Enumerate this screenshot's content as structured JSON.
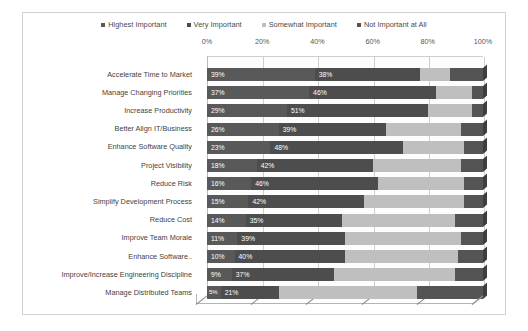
{
  "title": "",
  "legend": {
    "position": "top",
    "items": [
      {
        "label": "Highest Important",
        "color": "#595959"
      },
      {
        "label": "Very Important",
        "color": "#4d4d4d"
      },
      {
        "label": "Somewhat Important",
        "color": "#bfbfbf"
      },
      {
        "label": "Not Important at All",
        "color": "#545454"
      }
    ]
  },
  "axis": {
    "ticks": [
      "0%",
      "20%",
      "40%",
      "60%",
      "80%",
      "100%"
    ],
    "min": 0,
    "max": 100
  },
  "chart_data": {
    "type": "bar",
    "orientation": "horizontal",
    "stacked": true,
    "three_d": true,
    "title": "",
    "xlabel": "",
    "ylabel": "",
    "xlim": [
      0,
      100
    ],
    "grid": true,
    "legend_position": "top",
    "tick_labels": [
      "0%",
      "20%",
      "40%",
      "60%",
      "80%",
      "100%"
    ],
    "categories": [
      "Accelerate Time to Market",
      "Manage Changing Priorities",
      "Increase Productivity",
      "Better Align IT/Business",
      "Enhance Software Quality",
      "Project Visibility",
      "Reduce Risk",
      "Simplify Development Process",
      "Reduce Cost",
      "Improve Team Morale",
      "Enhance Software..",
      "Improve/Increase Engineering Discipline",
      "Manage Distributed Teams"
    ],
    "series": [
      {
        "name": "Highest Important",
        "color": "#595959",
        "values": [
          39,
          37,
          29,
          26,
          23,
          18,
          16,
          15,
          14,
          11,
          10,
          9,
          5
        ],
        "labels": [
          "39%",
          "37%",
          "29%",
          "26%",
          "23%",
          "18%",
          "16%",
          "15%",
          "14%",
          "11%",
          "10%",
          "9%",
          "5%"
        ]
      },
      {
        "name": "Very Important",
        "color": "#4d4d4d",
        "values": [
          38,
          46,
          51,
          39,
          48,
          42,
          46,
          42,
          35,
          39,
          40,
          37,
          21
        ],
        "labels": [
          "38%",
          "46%",
          "51%",
          "39%",
          "48%",
          "42%",
          "46%",
          "42%",
          "35%",
          "39%",
          "40%",
          "37%",
          "21%"
        ]
      },
      {
        "name": "Somewhat Important",
        "color": "#bfbfbf",
        "values": [
          11,
          13,
          16,
          27,
          22,
          32,
          31,
          36,
          41,
          42,
          41,
          44,
          50
        ],
        "labels": [
          "",
          "",
          "",
          "",
          "",
          "",
          "",
          "",
          "",
          "",
          "",
          "",
          ""
        ]
      },
      {
        "name": "Not Important at All",
        "color": "#545454",
        "values": [
          12,
          4,
          4,
          8,
          7,
          8,
          7,
          7,
          10,
          8,
          9,
          10,
          24
        ],
        "labels": [
          "",
          "",
          "",
          "",
          "",
          "",
          "",
          "",
          "",
          "",
          "",
          "",
          ""
        ]
      }
    ]
  }
}
